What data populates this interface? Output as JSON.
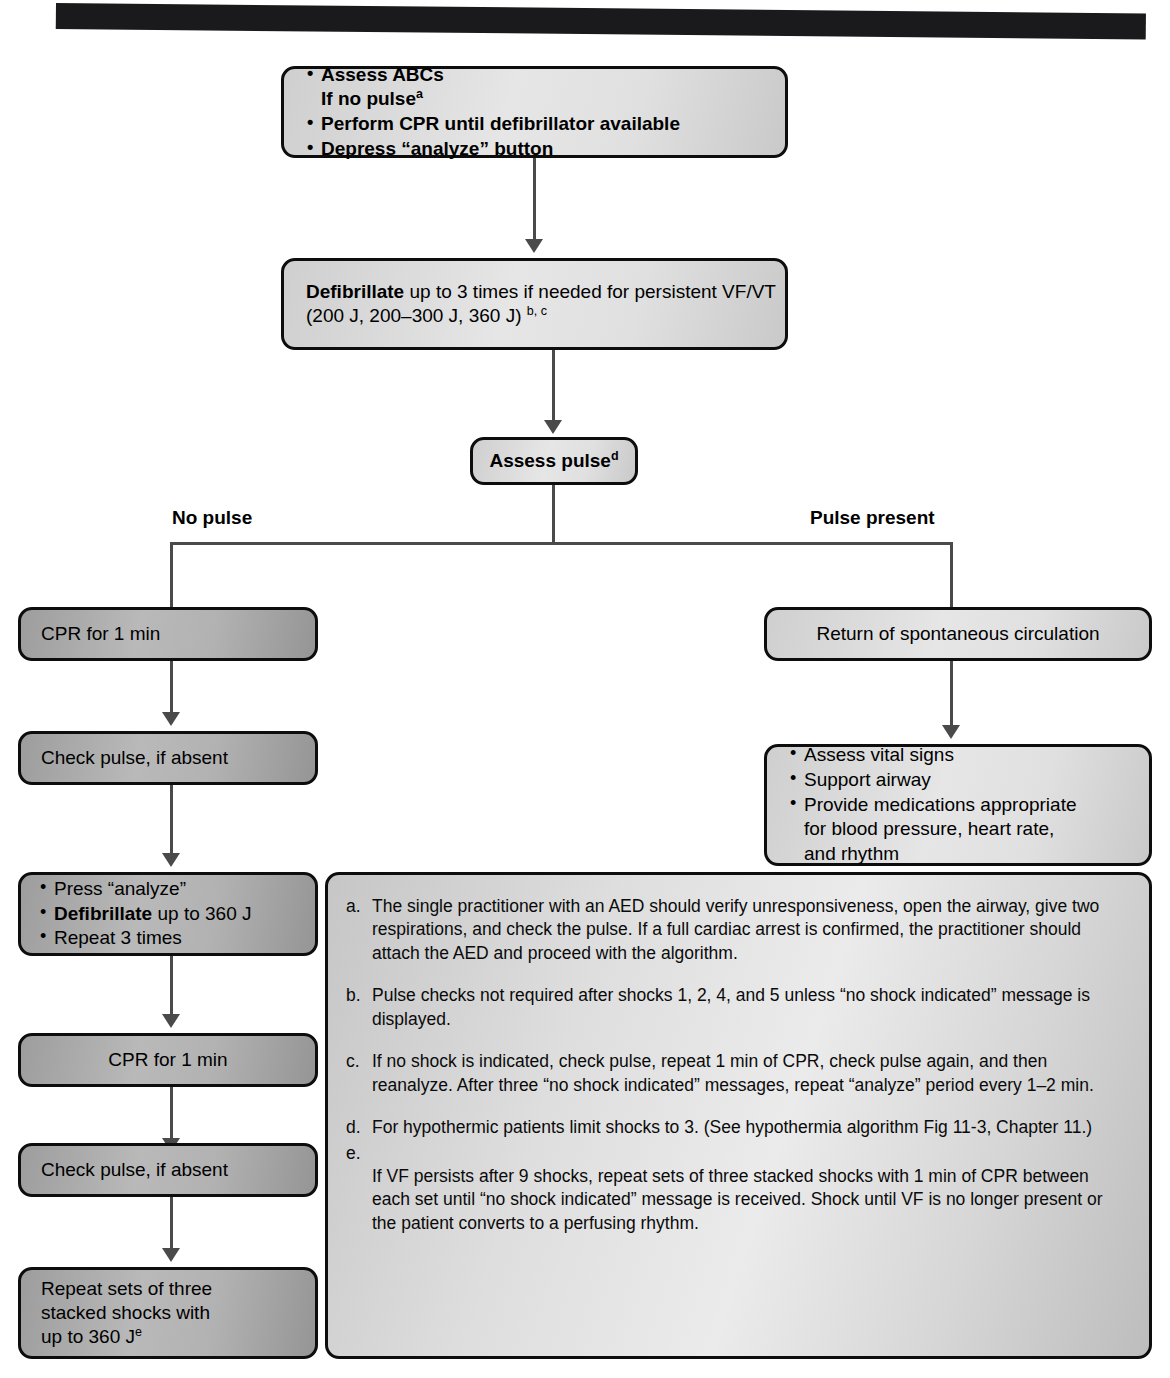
{
  "nodes": {
    "assess_abcs": {
      "items": [
        "Assess ABCs",
        "If no pulse",
        "Perform CPR until defibrillator available",
        "Depress “analyze” button"
      ],
      "superscript": "a"
    },
    "defibrillate": {
      "bold_lead": "Defibrillate",
      "line1_rest": " up to 3 times if needed for persistent VF/VT",
      "line2": "(200 J, 200–300 J, 360 J) ",
      "line2_superscript": "b, c"
    },
    "assess_pulse": {
      "label": "Assess pulse",
      "superscript": "d"
    },
    "branch_left_label": "No pulse",
    "branch_right_label": "Pulse present",
    "cpr_1": "CPR for 1 min",
    "check_pulse_1": "Check pulse, if absent",
    "press_analyze": {
      "item1": "Press “analyze”",
      "item2_bold": "Defibrillate",
      "item2_rest": " up to 360 J",
      "item3": "Repeat 3 times"
    },
    "cpr_2": "CPR for 1 min",
    "check_pulse_2": "Check pulse, if absent",
    "repeat_sets": {
      "line1": "Repeat sets of three",
      "line2": "stacked shocks with",
      "line3": "up to 360 J",
      "superscript": "e"
    },
    "rosc": "Return of spontaneous circulation",
    "post_resus": {
      "item1": "Assess vital signs",
      "item2": "Support airway",
      "item3": "Provide medications appropriate",
      "item3_cont1": "for blood pressure, heart rate,",
      "item3_cont2": "and rhythm"
    }
  },
  "footnotes": [
    {
      "mark": "a.",
      "text": "The single practitioner with an AED should verify unresponsiveness, open the airway, give two respirations, and check the pulse. If a full cardiac arrest is confirmed, the practitioner should attach the AED and proceed with the algorithm."
    },
    {
      "mark": "b.",
      "text": "Pulse checks not required after shocks 1, 2, 4, and 5 unless “no shock indicated” message is displayed."
    },
    {
      "mark": "c.",
      "text": "If no shock is indicated, check pulse, repeat 1 min of CPR, check pulse again, and then reanalyze. After three “no shock indicated” messages, repeat “analyze” period every 1–2 min."
    },
    {
      "mark": "d.",
      "text": "For hypothermic patients limit shocks to 3. (See hypothermia algorithm Fig 11-3, Chapter 11.)"
    },
    {
      "mark": "e.",
      "text": "If VF persists after 9 shocks, repeat sets of three stacked shocks with 1 min of CPR between each set until “no shock indicated” message is received. Shock until VF is no longer present or the patient converts to a perfusing rhythm."
    }
  ],
  "colors": {
    "box_border": "#0d0d0d",
    "connector": "#4a4a4a",
    "box_fill_light": "#e2e2e2",
    "box_fill_dark": "#b2b2b2",
    "text": "#000000"
  }
}
